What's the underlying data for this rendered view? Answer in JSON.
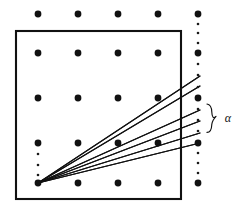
{
  "figure": {
    "background_color": "#ffffff",
    "ink_color": "#111111",
    "width": 244,
    "height": 216
  },
  "annotation": {
    "alpha_label": "α",
    "alpha_label_x": 228,
    "alpha_label_y": 119,
    "brace_note": "curly brace spanning the ray endpoint spread"
  },
  "box": {
    "x": 16,
    "y": 31,
    "width": 165,
    "height": 168,
    "stroke_width": 2.1
  },
  "chart_data": {
    "type": "scatter",
    "xlabel": "",
    "ylabel": "",
    "grid": false,
    "legend": false,
    "xlim": [
      0,
      244
    ],
    "ylim": [
      0,
      216
    ],
    "lattice": {
      "description": "Square lattice of large points, 5 columns by 5 rows",
      "columns_x": [
        38,
        78,
        118,
        158,
        198
      ],
      "rows_y": [
        14,
        53,
        98,
        143,
        183
      ],
      "dot_radius": 3.4,
      "points": [
        {
          "x": 38,
          "y": 14
        },
        {
          "x": 78,
          "y": 14
        },
        {
          "x": 118,
          "y": 14
        },
        {
          "x": 158,
          "y": 14
        },
        {
          "x": 198,
          "y": 14
        },
        {
          "x": 38,
          "y": 53
        },
        {
          "x": 78,
          "y": 53
        },
        {
          "x": 118,
          "y": 53
        },
        {
          "x": 158,
          "y": 53
        },
        {
          "x": 198,
          "y": 53
        },
        {
          "x": 38,
          "y": 98
        },
        {
          "x": 78,
          "y": 98
        },
        {
          "x": 118,
          "y": 98
        },
        {
          "x": 158,
          "y": 98
        },
        {
          "x": 198,
          "y": 98
        },
        {
          "x": 38,
          "y": 143
        },
        {
          "x": 78,
          "y": 143
        },
        {
          "x": 118,
          "y": 143
        },
        {
          "x": 158,
          "y": 143
        },
        {
          "x": 198,
          "y": 143
        },
        {
          "x": 38,
          "y": 183
        },
        {
          "x": 78,
          "y": 183
        },
        {
          "x": 118,
          "y": 183
        },
        {
          "x": 158,
          "y": 183
        },
        {
          "x": 198,
          "y": 183
        }
      ]
    },
    "small_points": {
      "description": "Fine intermediate points; dense column at x=198 and partial column at x=38",
      "dot_radius": 1.3,
      "points": [
        {
          "x": 198,
          "y": 24
        },
        {
          "x": 198,
          "y": 33
        },
        {
          "x": 198,
          "y": 43
        },
        {
          "x": 198,
          "y": 64
        },
        {
          "x": 198,
          "y": 75
        },
        {
          "x": 198,
          "y": 87
        },
        {
          "x": 198,
          "y": 109
        },
        {
          "x": 198,
          "y": 120
        },
        {
          "x": 198,
          "y": 131
        },
        {
          "x": 198,
          "y": 153
        },
        {
          "x": 198,
          "y": 163
        },
        {
          "x": 198,
          "y": 173
        },
        {
          "x": 38,
          "y": 154
        },
        {
          "x": 38,
          "y": 165
        },
        {
          "x": 38,
          "y": 175
        }
      ]
    },
    "rays": {
      "description": "Six straight rays from the bottom-left lattice point fanning to the right column",
      "origin": {
        "x": 38,
        "y": 183
      },
      "series": [
        {
          "name": "ray-1",
          "x2": 200,
          "y2": 76,
          "slope_note": "steepest; passes near (78,143)"
        },
        {
          "name": "ray-2",
          "x2": 200,
          "y2": 86,
          "slope_note": "passes near (158,98)"
        },
        {
          "name": "ray-3",
          "x2": 200,
          "y2": 110,
          "slope_note": "mid"
        },
        {
          "name": "ray-4",
          "x2": 200,
          "y2": 121,
          "slope_note": "mid-low"
        },
        {
          "name": "ray-5",
          "x2": 200,
          "y2": 133,
          "slope_note": "low"
        },
        {
          "name": "ray-6",
          "x2": 200,
          "y2": 143,
          "slope_note": "shallowest; ends at (198,143)"
        }
      ]
    },
    "brace": {
      "x": 210,
      "y_top": 104,
      "y_bottom": 136,
      "points_to": "angular spread alpha"
    }
  }
}
